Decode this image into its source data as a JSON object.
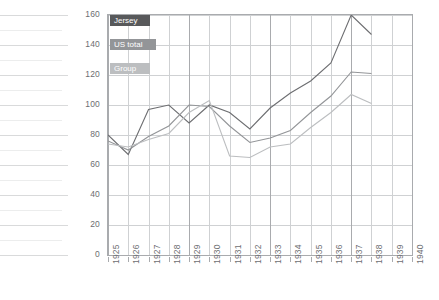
{
  "chart_data": {
    "type": "line",
    "title": "",
    "subtitle": "",
    "xlabel": "",
    "ylabel": "",
    "xlim": [
      1925,
      1940
    ],
    "ylim": [
      0,
      160
    ],
    "ytick_step": 20,
    "grid": true,
    "grid_minor_step": 10,
    "legend_position": "top-left inside plot",
    "categories": [
      1925,
      1926,
      1927,
      1928,
      1929,
      1930,
      1931,
      1932,
      1933,
      1934,
      1935,
      1936,
      1937,
      1938,
      1939,
      1940
    ],
    "x_tick_labels": [
      "1925",
      "1926",
      "1927",
      "1928",
      "1929",
      "1930",
      "1931",
      "1932",
      "1933",
      "1934",
      "1935",
      "1936",
      "1937",
      "1938",
      "1939",
      "1940"
    ],
    "y_tick_labels": [
      "0",
      "20",
      "40",
      "60",
      "80",
      "100",
      "120",
      "140",
      "160"
    ],
    "y_tick_values": [
      0,
      20,
      40,
      60,
      80,
      100,
      120,
      140,
      160
    ],
    "series": [
      {
        "name": "Jersey",
        "color": "#6d6e71",
        "values": [
          80,
          67,
          97,
          100,
          88,
          100,
          95,
          84,
          98,
          108,
          116,
          128,
          160,
          147,
          null,
          null
        ]
      },
      {
        "name": "US total",
        "color": "#939598",
        "values": [
          76,
          70,
          79,
          86,
          100,
          99,
          86,
          75,
          78,
          83,
          95,
          106,
          122,
          121,
          null,
          null
        ]
      },
      {
        "name": "Group",
        "color": "#bcbec0",
        "values": [
          74,
          72,
          77,
          81,
          95,
          103,
          66,
          65,
          72,
          74,
          85,
          95,
          107,
          101,
          null,
          null
        ]
      }
    ]
  },
  "legend": {
    "items": [
      {
        "label": "Jersey",
        "swatch_color": "#58595b",
        "text_color": "#ffffff"
      },
      {
        "label": "US total",
        "swatch_color": "#939598",
        "text_color": "#ffffff"
      },
      {
        "label": "Group",
        "swatch_color": "#bcbec0",
        "text_color": "#ffffff"
      }
    ]
  },
  "colors": {
    "jersey": "#6d6e71",
    "us_total": "#939598",
    "group": "#bcbec0",
    "gridline": "#cfd1d3",
    "axis": "#a9abae",
    "text": "#6d6e71",
    "background": "#ffffff"
  }
}
